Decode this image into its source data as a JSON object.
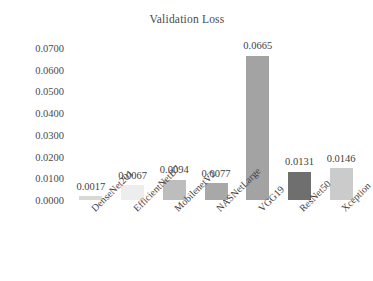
{
  "chart_data": {
    "type": "bar",
    "title": "Validation Loss",
    "xlabel": "",
    "ylabel": "",
    "categories": [
      "DenseNet201",
      "EfficientNetB7",
      "MobilenetV2",
      "NASNetLarge",
      "VGG19",
      "ResNet50",
      "Xception"
    ],
    "values": [
      0.0017,
      0.0067,
      0.0094,
      0.0077,
      0.0665,
      0.0131,
      0.0146
    ],
    "value_labels": [
      "0.0017",
      "0.0067",
      "0.0094",
      "0.0077",
      "0.0665",
      "0.0131",
      "0.0146"
    ],
    "bar_colors": [
      "#d8d8d8",
      "#ededed",
      "#bdbdbd",
      "#a8a8a8",
      "#a3a3a3",
      "#6f6f6f",
      "#cbcbcb"
    ],
    "ylim": [
      0.0,
      0.07
    ],
    "yticks": [
      0.07,
      0.06,
      0.05,
      0.04,
      0.03,
      0.02,
      0.01,
      0.0
    ],
    "ytick_labels": [
      "0.0700",
      "0.0600",
      "0.0500",
      "0.0400",
      "0.0300",
      "0.0200",
      "0.0100",
      "0.0000"
    ],
    "grid": false,
    "legend": false,
    "legend_position": "none",
    "data_labels_shown": true
  }
}
